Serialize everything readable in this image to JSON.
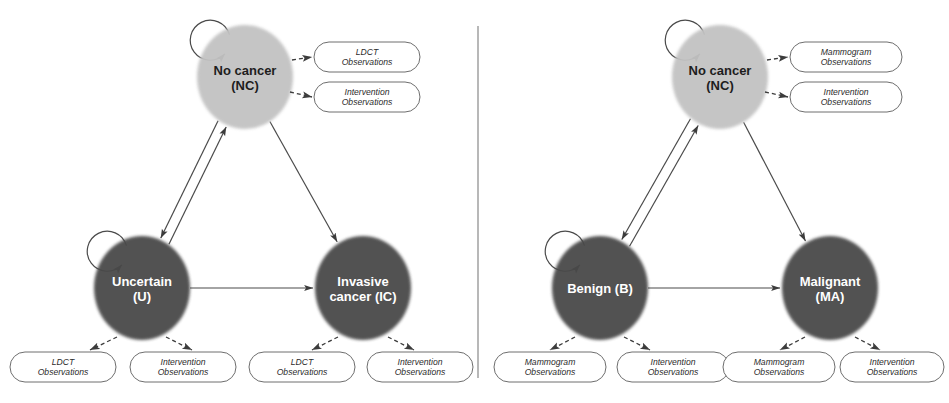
{
  "figure": {
    "divider": {
      "name": "panel-divider"
    }
  },
  "colors": {
    "node_light": "#c2c2c2",
    "node_dark": "#484848",
    "node_light_text": "#1d1d1d",
    "node_dark_text": "#ffffff",
    "edge": "#4a4a4a",
    "obs_border": "#6e6e6e",
    "obs_fill": "#ffffff",
    "divider": "#9a9a9a",
    "background": "#ffffff"
  },
  "panels": [
    {
      "id": "lung",
      "name": "lung-cancer-panel",
      "states": [
        {
          "id": "nc",
          "name": "state-no-cancer",
          "label_lines": [
            "No cancer",
            "(NC)"
          ],
          "shade": "light",
          "cx": 245,
          "cy": 77,
          "rx": 48,
          "ry": 52,
          "self_loop": true
        },
        {
          "id": "u",
          "name": "state-uncertain",
          "label_lines": [
            "Uncertain",
            "(U)"
          ],
          "shade": "dark",
          "cx": 142,
          "cy": 288,
          "rx": 48,
          "ry": 52,
          "self_loop": true
        },
        {
          "id": "ic",
          "name": "state-invasive-cancer",
          "label_lines": [
            "Invasive",
            "cancer (IC)"
          ],
          "shade": "dark",
          "cx": 363,
          "cy": 288,
          "rx": 48,
          "ry": 52,
          "self_loop": false
        }
      ],
      "transitions": [
        {
          "name": "transition-nc-to-u",
          "from": "nc",
          "to": "u",
          "bidirectional": true
        },
        {
          "name": "transition-nc-to-ic",
          "from": "nc",
          "to": "ic",
          "bidirectional": false
        },
        {
          "name": "transition-u-to-ic",
          "from": "u",
          "to": "ic",
          "bidirectional": false
        }
      ],
      "observations": [
        {
          "name": "observation-nc-ldct",
          "state": "nc",
          "label_lines": [
            "LDCT",
            "Observations"
          ],
          "x": 314,
          "y": 42,
          "w": 106,
          "h": 30,
          "arrow_style": "dashed",
          "arrow": {
            "x1": 292,
            "y1": 60,
            "x2": 312,
            "y2": 57
          }
        },
        {
          "name": "observation-nc-intervention",
          "state": "nc",
          "label_lines": [
            "Intervention",
            "Observations"
          ],
          "x": 314,
          "y": 82,
          "w": 106,
          "h": 30,
          "arrow_style": "dashed",
          "arrow": {
            "x1": 290,
            "y1": 92,
            "x2": 312,
            "y2": 97
          }
        },
        {
          "name": "observation-u-ldct",
          "state": "u",
          "label_lines": [
            "LDCT",
            "Observations"
          ],
          "x": 10,
          "y": 352,
          "w": 106,
          "h": 30,
          "arrow_style": "dashed",
          "arrow": {
            "x1": 117,
            "y1": 337,
            "x2": 90,
            "y2": 350
          }
        },
        {
          "name": "observation-u-intervention",
          "state": "u",
          "label_lines": [
            "Intervention",
            "Observations"
          ],
          "x": 130,
          "y": 352,
          "w": 106,
          "h": 30,
          "arrow_style": "dashed",
          "arrow": {
            "x1": 166,
            "y1": 337,
            "x2": 192,
            "y2": 350
          }
        },
        {
          "name": "observation-ic-ldct",
          "state": "ic",
          "label_lines": [
            "LDCT",
            "Observations"
          ],
          "x": 249,
          "y": 352,
          "w": 106,
          "h": 30,
          "arrow_style": "dashed",
          "arrow": {
            "x1": 338,
            "y1": 337,
            "x2": 312,
            "y2": 350
          }
        },
        {
          "name": "observation-ic-intervention",
          "state": "ic",
          "label_lines": [
            "Intervention",
            "Observations"
          ],
          "x": 367,
          "y": 352,
          "w": 106,
          "h": 30,
          "arrow_style": "dashed",
          "arrow": {
            "x1": 388,
            "y1": 337,
            "x2": 414,
            "y2": 350
          }
        }
      ]
    },
    {
      "id": "breast",
      "name": "breast-cancer-panel",
      "states": [
        {
          "id": "nc2",
          "name": "state-no-cancer",
          "label_lines": [
            "No cancer",
            "(NC)"
          ],
          "shade": "light",
          "cx": 720,
          "cy": 77,
          "rx": 48,
          "ry": 52,
          "self_loop": true
        },
        {
          "id": "b",
          "name": "state-benign",
          "label_lines": [
            "Benign (B)"
          ],
          "shade": "dark",
          "cx": 600,
          "cy": 288,
          "rx": 48,
          "ry": 52,
          "self_loop": true
        },
        {
          "id": "ma",
          "name": "state-malignant",
          "label_lines": [
            "Malignant",
            "(MA)"
          ],
          "shade": "dark",
          "cx": 830,
          "cy": 288,
          "rx": 48,
          "ry": 52,
          "self_loop": false
        }
      ],
      "transitions": [
        {
          "name": "transition-nc-to-b",
          "from": "nc2",
          "to": "b",
          "bidirectional": true
        },
        {
          "name": "transition-nc-to-ma",
          "from": "nc2",
          "to": "ma",
          "bidirectional": false
        },
        {
          "name": "transition-b-to-ma",
          "from": "b",
          "to": "ma",
          "bidirectional": false
        }
      ],
      "observations": [
        {
          "name": "observation-nc-mammogram",
          "state": "nc2",
          "label_lines": [
            "Mammogram",
            "Observations"
          ],
          "x": 790,
          "y": 42,
          "w": 112,
          "h": 30,
          "arrow_style": "dashed",
          "arrow": {
            "x1": 767,
            "y1": 60,
            "x2": 788,
            "y2": 57
          }
        },
        {
          "name": "observation-nc-intervention",
          "state": "nc2",
          "label_lines": [
            "Intervention",
            "Observations"
          ],
          "x": 790,
          "y": 82,
          "w": 112,
          "h": 30,
          "arrow_style": "dashed",
          "arrow": {
            "x1": 765,
            "y1": 92,
            "x2": 788,
            "y2": 97
          }
        },
        {
          "name": "observation-b-mammogram",
          "state": "b",
          "label_lines": [
            "Mammogram",
            "Observations"
          ],
          "x": 494,
          "y": 352,
          "w": 112,
          "h": 30,
          "arrow_style": "dashed",
          "arrow": {
            "x1": 575,
            "y1": 337,
            "x2": 550,
            "y2": 350
          }
        },
        {
          "name": "observation-b-intervention",
          "state": "b",
          "label_lines": [
            "Intervention",
            "Observations"
          ],
          "x": 617,
          "y": 352,
          "w": 112,
          "h": 30,
          "arrow_style": "dashed",
          "arrow": {
            "x1": 624,
            "y1": 337,
            "x2": 650,
            "y2": 350
          }
        },
        {
          "name": "observation-ma-mammogram",
          "state": "ma",
          "label_lines": [
            "Mammogram",
            "Observations"
          ],
          "x": 723,
          "y": 352,
          "w": 112,
          "h": 30,
          "arrow_style": "dashed",
          "arrow": {
            "x1": 805,
            "y1": 337,
            "x2": 780,
            "y2": 350
          }
        },
        {
          "name": "observation-ma-intervention",
          "state": "ma",
          "label_lines": [
            "Intervention",
            "Observations"
          ],
          "x": 840,
          "y": 352,
          "w": 104,
          "h": 30,
          "arrow_style": "dashed",
          "arrow": {
            "x1": 855,
            "y1": 337,
            "x2": 880,
            "y2": 350
          }
        }
      ]
    }
  ]
}
